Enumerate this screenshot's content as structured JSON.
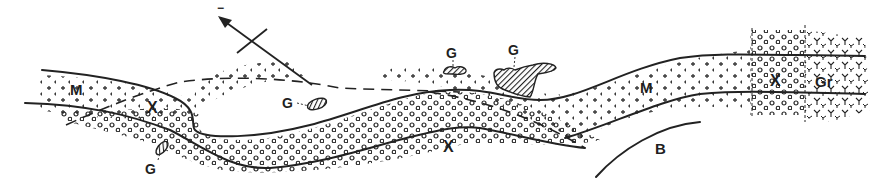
{
  "figure": {
    "type": "geological cross-section",
    "labels": {
      "mica_schist_west": "M",
      "conglomerate_west": "X",
      "conglomerate_center": "X",
      "mica_schist_east": "M",
      "conglomerate_east": "X",
      "granite": "Gr",
      "basement": "B",
      "gold_1": "G",
      "gold_2": "G",
      "gold_3": "G",
      "gold_4": "G",
      "arrow_sign": "−"
    },
    "colors": {
      "ink": "#222222",
      "background": "#ffffff"
    }
  }
}
